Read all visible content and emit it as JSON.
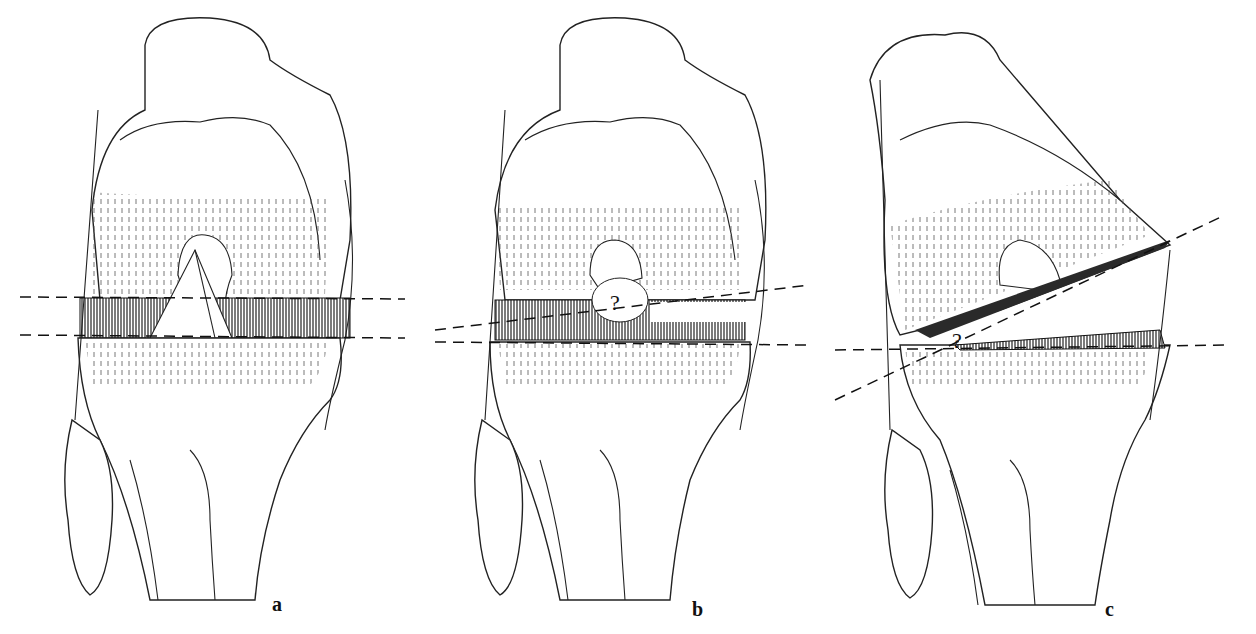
{
  "figure": {
    "panels": [
      {
        "id": "a",
        "label": "a",
        "description": "Knee joint, front view, intact menisci and cruciate ligaments with two horizontal dashed planes"
      },
      {
        "id": "b",
        "label": "b",
        "description": "Knee joint with tear; dashed plane diverging, question mark at ligament",
        "annotation": "?"
      },
      {
        "id": "c",
        "label": "c",
        "description": "Knee joint opened at angle; diagonal dashed plane with question mark",
        "annotation": "?"
      }
    ]
  }
}
